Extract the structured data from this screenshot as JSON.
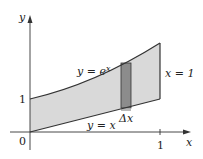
{
  "diagram": {
    "axes": {
      "x_label": "x",
      "y_label": "y",
      "origin_label": "0",
      "x_tick_label": "1",
      "y_tick_label": "1"
    },
    "curves": {
      "upper": {
        "label_lhs": "y = e",
        "label_exp": "x"
      },
      "lower": {
        "label": "y = x"
      }
    },
    "boundary": {
      "label": "x = 1"
    },
    "strip": {
      "label": "Δx"
    },
    "colors": {
      "region_fill": "#d9d9d9",
      "strip_fill": "#8c8c8c",
      "curve_stroke": "#333333",
      "axis_stroke": "#333333"
    }
  }
}
